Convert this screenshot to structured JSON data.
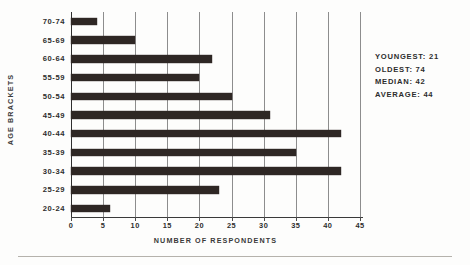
{
  "chart_data": {
    "type": "bar",
    "orientation": "horizontal",
    "title": "",
    "xlabel": "NUMBER OF RESPONDENTS",
    "ylabel": "AGE BRACKETS",
    "categories": [
      "70-74",
      "65-69",
      "60-64",
      "55-59",
      "50-54",
      "45-49",
      "40-44",
      "35-39",
      "30-34",
      "25-29",
      "20-24"
    ],
    "values": [
      4,
      10,
      22,
      20,
      25,
      31,
      42,
      35,
      42,
      23,
      6
    ],
    "xlim": [
      0,
      45
    ],
    "xticks": [
      0,
      5,
      10,
      15,
      20,
      25,
      30,
      35,
      40,
      45
    ],
    "xtick_labels": [
      "0",
      "5",
      "10",
      "15",
      "20",
      "25",
      "30",
      "35",
      "40",
      "45"
    ],
    "grid": "vertical",
    "legend": "none",
    "bar_color": "#2e2724",
    "annotations": [
      "YOUNGEST: 21",
      "OLDEST: 74",
      "MEDIAN: 42",
      "AVERAGE: 44"
    ]
  },
  "stats": {
    "youngest": "YOUNGEST: 21",
    "oldest": "OLDEST: 74",
    "median": "MEDIAN: 42",
    "average": "AVERAGE: 44"
  }
}
